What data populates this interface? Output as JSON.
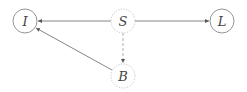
{
  "nodes": {
    "I": {
      "label": "I",
      "style": "solid"
    },
    "S": {
      "label": "S",
      "style": "dotted"
    },
    "L": {
      "label": "L",
      "style": "solid"
    },
    "B": {
      "label": "B",
      "style": "dotted"
    }
  },
  "edges": [
    {
      "from": "S",
      "to": "I",
      "style": "solid"
    },
    {
      "from": "S",
      "to": "L",
      "style": "solid"
    },
    {
      "from": "S",
      "to": "B",
      "style": "dashed"
    },
    {
      "from": "B",
      "to": "I",
      "style": "solid"
    }
  ],
  "colors": {
    "solid_node": "#777777",
    "dotted_node": "#bbbbbb",
    "edge": "#555555"
  }
}
